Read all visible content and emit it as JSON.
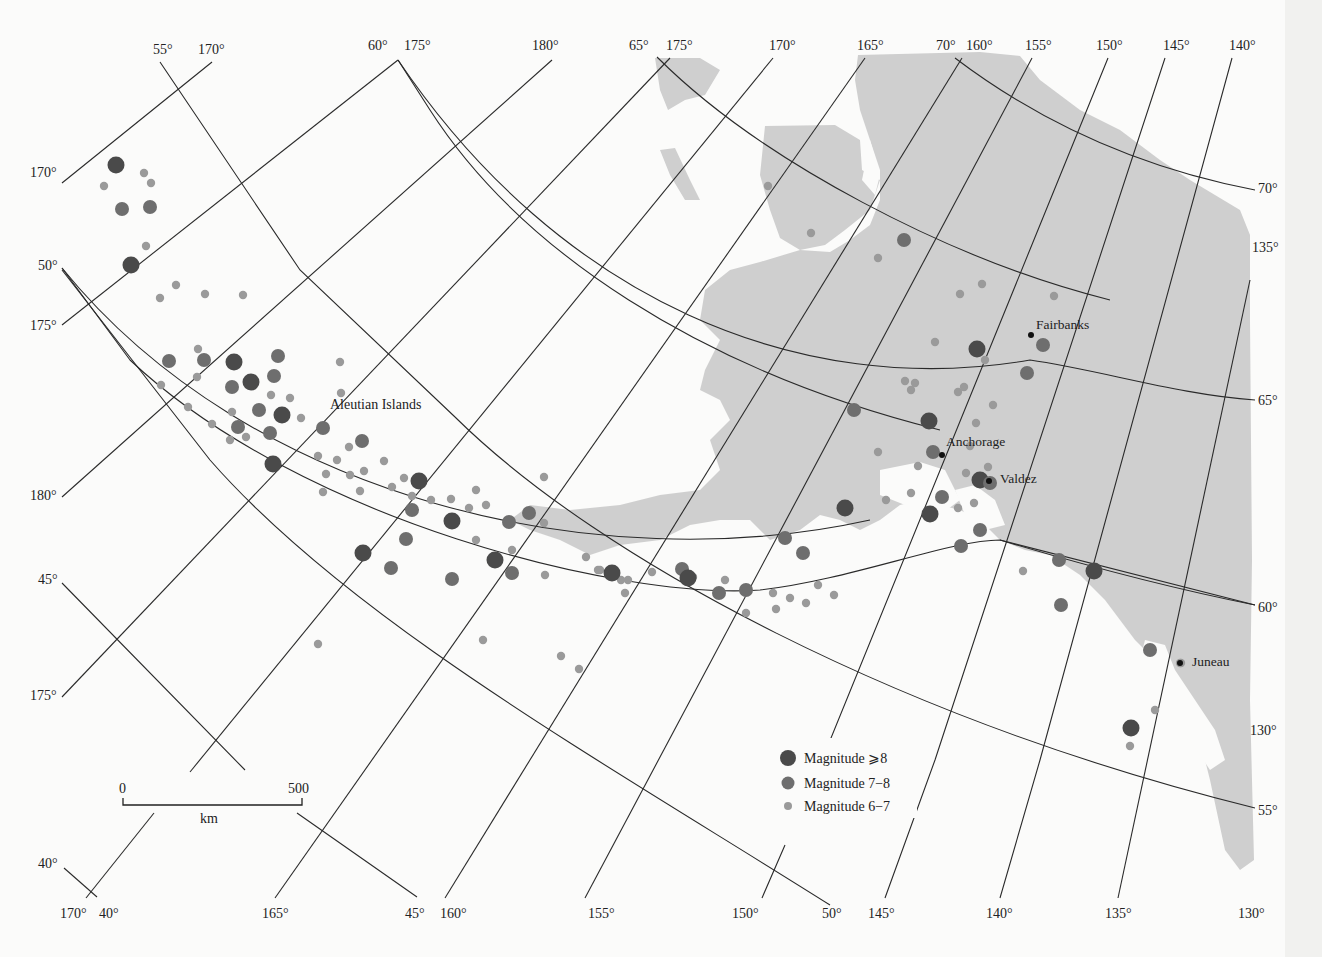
{
  "map": {
    "region_label": "Aleutian Islands",
    "cities": [
      {
        "name": "Fairbanks",
        "x": 1031,
        "y": 335,
        "lx": 1036,
        "ly": 329
      },
      {
        "name": "Anchorage",
        "x": 942,
        "y": 455,
        "lx": 946,
        "ly": 446
      },
      {
        "name": "Valdez",
        "x": 989,
        "y": 481,
        "lx": 1000,
        "ly": 483
      },
      {
        "name": "Juneau",
        "x": 1180,
        "y": 663,
        "lx": 1192,
        "ly": 666
      }
    ],
    "top_labels": [
      {
        "text": "55°",
        "x": 153,
        "y": 54
      },
      {
        "text": "170°",
        "x": 198,
        "y": 54
      },
      {
        "text": "60°",
        "x": 368,
        "y": 50
      },
      {
        "text": "175°",
        "x": 404,
        "y": 50
      },
      {
        "text": "180°",
        "x": 532,
        "y": 50
      },
      {
        "text": "65°",
        "x": 629,
        "y": 50
      },
      {
        "text": "175°",
        "x": 666,
        "y": 50
      },
      {
        "text": "170°",
        "x": 769,
        "y": 50
      },
      {
        "text": "165°",
        "x": 857,
        "y": 50
      },
      {
        "text": "70°",
        "x": 936,
        "y": 50
      },
      {
        "text": "160°",
        "x": 966,
        "y": 50
      },
      {
        "text": "155°",
        "x": 1025,
        "y": 50
      },
      {
        "text": "150°",
        "x": 1096,
        "y": 50
      },
      {
        "text": "145°",
        "x": 1163,
        "y": 50
      },
      {
        "text": "140°",
        "x": 1229,
        "y": 50
      }
    ],
    "left_labels": [
      {
        "text": "170°",
        "x": 30,
        "y": 177
      },
      {
        "text": "50°",
        "x": 38,
        "y": 270
      },
      {
        "text": "175°",
        "x": 30,
        "y": 330
      },
      {
        "text": "180°",
        "x": 30,
        "y": 500
      },
      {
        "text": "45°",
        "x": 38,
        "y": 584
      },
      {
        "text": "175°",
        "x": 30,
        "y": 700
      },
      {
        "text": "40°",
        "x": 38,
        "y": 868
      }
    ],
    "right_labels": [
      {
        "text": "70°",
        "x": 1258,
        "y": 193
      },
      {
        "text": "135°",
        "x": 1252,
        "y": 252
      },
      {
        "text": "65°",
        "x": 1258,
        "y": 405
      },
      {
        "text": "60°",
        "x": 1258,
        "y": 612
      },
      {
        "text": "130°",
        "x": 1250,
        "y": 735
      },
      {
        "text": "55°",
        "x": 1258,
        "y": 815
      }
    ],
    "bottom_labels": [
      {
        "text": "170°",
        "x": 60,
        "y": 918
      },
      {
        "text": "40°",
        "x": 99,
        "y": 918
      },
      {
        "text": "165°",
        "x": 262,
        "y": 918
      },
      {
        "text": "45°",
        "x": 405,
        "y": 918
      },
      {
        "text": "160°",
        "x": 440,
        "y": 918
      },
      {
        "text": "155°",
        "x": 588,
        "y": 918
      },
      {
        "text": "150°",
        "x": 732,
        "y": 918
      },
      {
        "text": "50°",
        "x": 822,
        "y": 918
      },
      {
        "text": "145°",
        "x": 868,
        "y": 918
      },
      {
        "text": "140°",
        "x": 986,
        "y": 918
      },
      {
        "text": "135°",
        "x": 1105,
        "y": 918
      },
      {
        "text": "130°",
        "x": 1238,
        "y": 918
      }
    ]
  },
  "scale_bar": {
    "start_label": "0",
    "end_label": "500",
    "unit": "km"
  },
  "legend": {
    "items": [
      {
        "label": "Magnitude  ⩾8",
        "size": "large"
      },
      {
        "label": "Magnitude 7−8",
        "size": "medium"
      },
      {
        "label": "Magnitude 6−7",
        "size": "small"
      }
    ]
  },
  "colors": {
    "land": "#cfcfcf",
    "mag8": "#4a4a4a",
    "mag7": "#6e6e6e",
    "mag6": "#9a9a9a",
    "grid": "#2a2a2a"
  },
  "epicenters": {
    "mag8": [
      [
        116,
        165
      ],
      [
        122,
        209
      ],
      [
        150,
        207
      ],
      [
        131,
        265
      ],
      [
        169,
        361
      ],
      [
        278,
        356
      ],
      [
        234,
        362
      ],
      [
        204,
        360
      ],
      [
        274,
        376
      ],
      [
        251,
        382
      ],
      [
        232,
        387
      ],
      [
        259,
        410
      ],
      [
        282,
        415
      ],
      [
        238,
        427
      ],
      [
        270,
        433
      ],
      [
        273,
        464
      ],
      [
        362,
        441
      ],
      [
        323,
        428
      ],
      [
        419,
        481
      ],
      [
        412,
        510
      ],
      [
        406,
        539
      ],
      [
        363,
        553
      ],
      [
        391,
        568
      ],
      [
        452,
        579
      ],
      [
        452,
        521
      ],
      [
        509,
        522
      ],
      [
        529,
        513
      ],
      [
        495,
        560
      ],
      [
        512,
        573
      ],
      [
        682,
        569
      ],
      [
        688,
        578
      ],
      [
        719,
        593
      ],
      [
        746,
        590
      ],
      [
        612,
        573
      ],
      [
        785,
        538
      ],
      [
        803,
        553
      ],
      [
        845,
        508
      ],
      [
        854,
        410
      ],
      [
        904,
        240
      ],
      [
        977,
        349
      ],
      [
        1027,
        373
      ],
      [
        1043,
        345
      ],
      [
        929,
        421
      ],
      [
        933,
        452
      ],
      [
        942,
        497
      ],
      [
        930,
        514
      ],
      [
        961,
        546
      ],
      [
        980,
        530
      ],
      [
        980,
        480
      ],
      [
        990,
        483
      ],
      [
        1059,
        560
      ],
      [
        1094,
        571
      ],
      [
        1061,
        605
      ],
      [
        1150,
        650
      ],
      [
        1131,
        728
      ]
    ],
    "mag6": [
      [
        104,
        186
      ],
      [
        144,
        173
      ],
      [
        151,
        183
      ],
      [
        146,
        246
      ],
      [
        160,
        298
      ],
      [
        176,
        285
      ],
      [
        205,
        294
      ],
      [
        243,
        295
      ],
      [
        198,
        349
      ],
      [
        197,
        377
      ],
      [
        161,
        385
      ],
      [
        188,
        407
      ],
      [
        212,
        424
      ],
      [
        230,
        440
      ],
      [
        246,
        437
      ],
      [
        271,
        395
      ],
      [
        232,
        412
      ],
      [
        290,
        398
      ],
      [
        301,
        418
      ],
      [
        340,
        362
      ],
      [
        341,
        393
      ],
      [
        318,
        456
      ],
      [
        326,
        474
      ],
      [
        337,
        460
      ],
      [
        350,
        475
      ],
      [
        349,
        447
      ],
      [
        323,
        492
      ],
      [
        384,
        461
      ],
      [
        404,
        478
      ],
      [
        412,
        496
      ],
      [
        392,
        487
      ],
      [
        364,
        471
      ],
      [
        360,
        491
      ],
      [
        431,
        500
      ],
      [
        451,
        499
      ],
      [
        469,
        508
      ],
      [
        476,
        490
      ],
      [
        486,
        505
      ],
      [
        476,
        540
      ],
      [
        512,
        550
      ],
      [
        545,
        575
      ],
      [
        586,
        557
      ],
      [
        544,
        477
      ],
      [
        544,
        523
      ],
      [
        598,
        570
      ],
      [
        628,
        580
      ],
      [
        652,
        572
      ],
      [
        600,
        570
      ],
      [
        621,
        580
      ],
      [
        693,
        577
      ],
      [
        725,
        580
      ],
      [
        768,
        186
      ],
      [
        811,
        233
      ],
      [
        878,
        258
      ],
      [
        960,
        294
      ],
      [
        982,
        284
      ],
      [
        1054,
        296
      ],
      [
        935,
        342
      ],
      [
        985,
        360
      ],
      [
        993,
        405
      ],
      [
        905,
        381
      ],
      [
        915,
        383
      ],
      [
        911,
        390
      ],
      [
        958,
        392
      ],
      [
        964,
        387
      ],
      [
        976,
        423
      ],
      [
        970,
        446
      ],
      [
        988,
        467
      ],
      [
        966,
        473
      ],
      [
        878,
        452
      ],
      [
        918,
        466
      ],
      [
        911,
        493
      ],
      [
        886,
        500
      ],
      [
        958,
        508
      ],
      [
        974,
        503
      ],
      [
        1023,
        571
      ],
      [
        818,
        585
      ],
      [
        834,
        595
      ],
      [
        773,
        593
      ],
      [
        790,
        598
      ],
      [
        806,
        603
      ],
      [
        776,
        609
      ],
      [
        746,
        613
      ],
      [
        625,
        593
      ],
      [
        318,
        644
      ],
      [
        483,
        640
      ],
      [
        561,
        656
      ],
      [
        579,
        669
      ],
      [
        1181,
        663
      ],
      [
        1155,
        710
      ],
      [
        1130,
        746
      ],
      [
        1180,
        663
      ]
    ]
  },
  "land_paths": [
    "M655,58 L700,58 L720,70 L705,95 L685,100 L668,110 L660,90 Z",
    "M660,150 L675,148 L690,180 L700,200 L685,200 L670,175 Z",
    "M765,126 L835,125 L860,140 L862,170 L880,180 L870,210 L845,230 L825,245 L800,250 L780,238 L770,210 L760,175 Z",
    "M858,55 L980,52 L1020,56 L1040,80 L1080,110 L1120,130 L1160,160 L1190,180 L1215,195 L1240,210 L1250,235 L1250,320 L1252,560 L1250,700 L1254,860 L1240,870 L1225,850 L1210,780 L1195,720 L1175,690 L1155,660 L1135,640 L1105,600 L1080,575 L1050,555 L1025,550 L1000,540 L980,520 L960,510 L940,505 L920,500 L900,505 L880,520 L860,530 L840,520 L820,515 L800,530 L770,540 L750,520 L720,520 L690,525 L660,540 L620,545 L590,555 L560,540 L530,530 L510,520 L530,505 L570,510 L620,505 L660,495 L700,490 L720,470 L710,440 L730,420 L720,400 L700,390 L705,370 L720,340 L700,320 L705,290 L730,270 L760,262 L800,250 L830,252 L850,240 L870,225 L880,200 L880,170 L870,140 L860,110 L855,80 Z"
  ]
}
